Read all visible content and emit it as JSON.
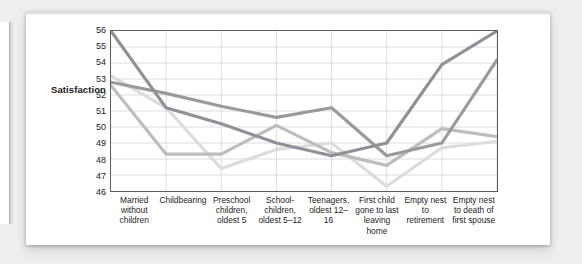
{
  "figure": {
    "y_axis_title": "Satisfaction",
    "y_ticks": [
      "56",
      "55",
      "54",
      "53",
      "52",
      "51",
      "50",
      "49",
      "48",
      "47",
      "46"
    ],
    "x_labels": [
      "Married without children",
      "Childbearing",
      "Preschool children, oldest 5",
      "School-children, oldest 5–12",
      "Teenagers, oldest 12–16",
      "First child gone to last leaving home",
      "Empty nest to retirement",
      "Empty nest to death of first spouse"
    ],
    "colors": {
      "series_1": "#8e9298",
      "series_2": "#9a9a9a",
      "series_3": "#bdbdbd",
      "series_4": "#dcdcdc",
      "grid": "#d9dde2",
      "axis": "#5d5d5d",
      "plot_background": "#ffffff",
      "card_background": "#ffffff",
      "page_background": "#eeeeee"
    }
  },
  "chart_data": {
    "type": "line",
    "title": "",
    "xlabel": "",
    "ylabel": "Satisfaction",
    "ylim": [
      46,
      56
    ],
    "ytick_step": 1,
    "grid": true,
    "legend": "none",
    "categories": [
      "Married without children",
      "Childbearing",
      "Preschool children, oldest 5",
      "School-children, oldest 5–12",
      "Teenagers, oldest 12–16",
      "First child gone to last leaving home",
      "Empty nest to retirement",
      "Empty nest to death of first spouse"
    ],
    "series": [
      {
        "name": "Series 1",
        "color": "#8e9298",
        "values": [
          56.0,
          51.2,
          50.2,
          49.0,
          48.2,
          49.0,
          53.9,
          56.0
        ]
      },
      {
        "name": "Series 2",
        "color": "#9a9a9a",
        "values": [
          52.8,
          52.1,
          51.3,
          50.6,
          51.2,
          48.2,
          49.0,
          54.2
        ]
      },
      {
        "name": "Series 3",
        "color": "#bdbdbd",
        "values": [
          52.6,
          48.3,
          48.3,
          50.1,
          48.4,
          47.6,
          49.9,
          49.4
        ]
      },
      {
        "name": "Series 4",
        "color": "#dcdcdc",
        "values": [
          53.2,
          51.2,
          47.4,
          48.6,
          49.0,
          46.3,
          48.7,
          49.1
        ]
      }
    ]
  }
}
